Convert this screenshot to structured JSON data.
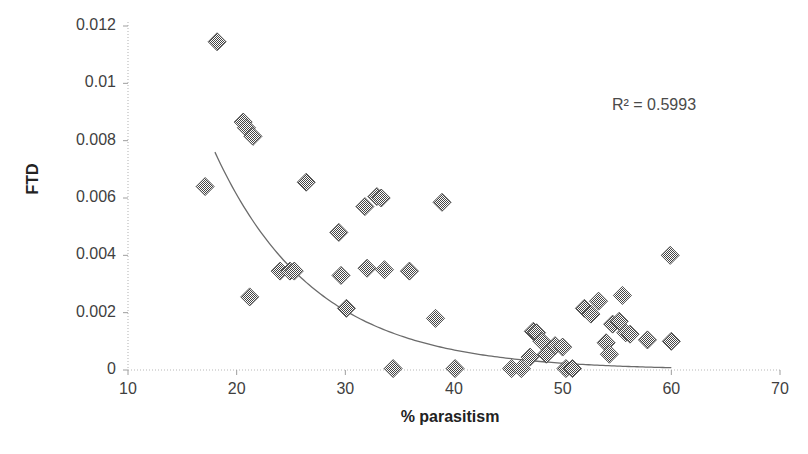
{
  "chart_data": {
    "type": "scatter",
    "title": "",
    "xlabel": "% parasitism",
    "ylabel": "FTD",
    "xlim": [
      10,
      70
    ],
    "ylim": [
      0,
      0.012
    ],
    "grid": false,
    "legend": "none",
    "xticks": [
      "10",
      "20",
      "30",
      "40",
      "50",
      "60",
      "70"
    ],
    "xtick_values": [
      10,
      20,
      30,
      40,
      50,
      60,
      70
    ],
    "yticks": [
      "0",
      "0.002",
      "0.004",
      "0.006",
      "0.008",
      "0.01",
      "0.012"
    ],
    "ytick_values": [
      0,
      0.002,
      0.004,
      0.006,
      0.008,
      0.01,
      0.012
    ],
    "annotations": [
      {
        "name": "r-squared",
        "text": "R² = 0.5993",
        "x": 65.0,
        "y": 0.0104
      }
    ],
    "series": [
      {
        "name": "FTD observations",
        "marker": "diamond",
        "marker_color": "#4a4a4a",
        "points": [
          {
            "x": 18.2,
            "y": 0.01145
          },
          {
            "x": 20.6,
            "y": 0.00865
          },
          {
            "x": 20.9,
            "y": 0.00845
          },
          {
            "x": 21.5,
            "y": 0.00815
          },
          {
            "x": 17.1,
            "y": 0.0064
          },
          {
            "x": 26.4,
            "y": 0.00655
          },
          {
            "x": 31.8,
            "y": 0.0057
          },
          {
            "x": 32.9,
            "y": 0.00605
          },
          {
            "x": 33.3,
            "y": 0.006
          },
          {
            "x": 38.9,
            "y": 0.00585
          },
          {
            "x": 29.4,
            "y": 0.0048
          },
          {
            "x": 21.2,
            "y": 0.00255
          },
          {
            "x": 24.0,
            "y": 0.00345
          },
          {
            "x": 24.9,
            "y": 0.00345
          },
          {
            "x": 25.3,
            "y": 0.00345
          },
          {
            "x": 29.6,
            "y": 0.0033
          },
          {
            "x": 32.0,
            "y": 0.00355
          },
          {
            "x": 33.6,
            "y": 0.0035
          },
          {
            "x": 35.9,
            "y": 0.00345
          },
          {
            "x": 30.1,
            "y": 0.00215
          },
          {
            "x": 38.3,
            "y": 0.0018
          },
          {
            "x": 34.4,
            "y": 5e-05
          },
          {
            "x": 40.1,
            "y": 5e-05
          },
          {
            "x": 45.3,
            "y": 5e-05
          },
          {
            "x": 46.2,
            "y": 5e-05
          },
          {
            "x": 47.0,
            "y": 0.00045
          },
          {
            "x": 47.3,
            "y": 0.00135
          },
          {
            "x": 47.6,
            "y": 0.0013
          },
          {
            "x": 48.1,
            "y": 0.001
          },
          {
            "x": 48.5,
            "y": 0.00055
          },
          {
            "x": 49.3,
            "y": 0.00085
          },
          {
            "x": 50.0,
            "y": 0.0008
          },
          {
            "x": 50.3,
            "y": 5e-05
          },
          {
            "x": 50.9,
            "y": 5e-05
          },
          {
            "x": 52.0,
            "y": 0.00215
          },
          {
            "x": 52.6,
            "y": 0.00195
          },
          {
            "x": 53.3,
            "y": 0.0024
          },
          {
            "x": 54.0,
            "y": 0.00095
          },
          {
            "x": 54.3,
            "y": 0.00055
          },
          {
            "x": 54.6,
            "y": 0.0016
          },
          {
            "x": 55.2,
            "y": 0.0017
          },
          {
            "x": 55.5,
            "y": 0.0026
          },
          {
            "x": 55.8,
            "y": 0.0013
          },
          {
            "x": 56.2,
            "y": 0.00125
          },
          {
            "x": 57.8,
            "y": 0.00105
          },
          {
            "x": 59.9,
            "y": 0.004
          },
          {
            "x": 60.0,
            "y": 0.001
          }
        ]
      }
    ],
    "trendline": {
      "name": "exponential-fit",
      "r_squared": 0.5993,
      "color": "#6b6b6b",
      "x_start": 18.0,
      "x_end": 60.0,
      "y_start": 0.0076,
      "y_end": 8e-05
    }
  },
  "axes": {
    "y_title": "FTD",
    "x_title": "% parasitism"
  }
}
